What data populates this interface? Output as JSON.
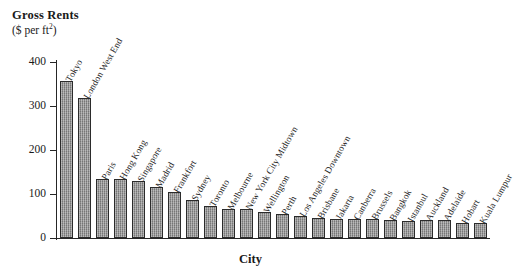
{
  "chart_data": {
    "type": "bar",
    "title": "Gross Rents",
    "subtitle": "($ per ft²)",
    "ylabel": "Gross Rents ($ per ft2)",
    "xlabel": "City",
    "ylim": [
      0,
      400
    ],
    "yticks": [
      0,
      100,
      200,
      300,
      400
    ],
    "grid": false,
    "legend": null,
    "categories": [
      "Tokyo",
      "London West End",
      "Paris",
      "Hong Kong",
      "Singapore",
      "Madrid",
      "Frankfort",
      "Sydney",
      "Toronto",
      "Melbourne",
      "New York City Midtown",
      "Wellington",
      "Perth",
      "Los Angeles Downtown",
      "Brisbane",
      "Jakarta",
      "Canberra",
      "Brussels",
      "Bangkok",
      "Istanbul",
      "Auckland",
      "Adelaide",
      "Hobart",
      "Kuala Lumpur"
    ],
    "values": [
      356,
      318,
      134,
      133,
      129,
      116,
      105,
      86,
      73,
      67,
      66,
      60,
      55,
      49,
      45,
      44,
      43,
      43,
      42,
      38,
      41,
      40,
      35,
      35
    ]
  },
  "axis": {
    "y_tick_labels": [
      "0",
      "100",
      "200",
      "300",
      "400"
    ],
    "x_axis_title": "City"
  },
  "header": {
    "title": "Gross Rents",
    "units": "($ per ft",
    "units_sup": "2",
    "units_close": ")"
  },
  "style": {
    "bar_fill": "#8e8e8e",
    "bar_border": "#2b2b2b",
    "axis_color": "#262626",
    "background": "#ffffff"
  }
}
